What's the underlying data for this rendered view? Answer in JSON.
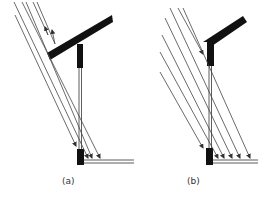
{
  "figure": {
    "panels": [
      {
        "id": "a",
        "label": "(a)",
        "description": "Sloped overhang roof reflecting some incident rays; remaining parallel rays reach wall base and ground"
      },
      {
        "id": "b",
        "label": "(b)",
        "description": "Shorter bent overhang; more parallel rays reach wall base and ground"
      }
    ]
  },
  "colors": {
    "ink": "#111111",
    "ray": "#444444",
    "background": "#ffffff"
  }
}
